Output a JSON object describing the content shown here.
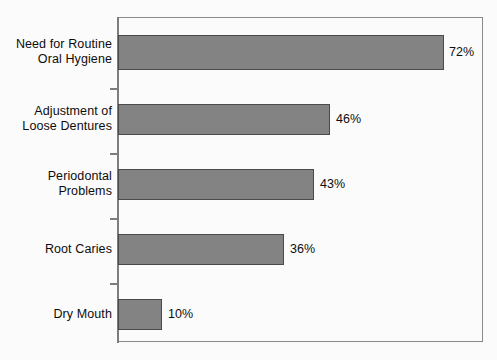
{
  "chart_data": {
    "type": "bar",
    "orientation": "horizontal",
    "title": "",
    "xlabel": "",
    "ylabel": "",
    "xlim": [
      0,
      100
    ],
    "grid": false,
    "legend": false,
    "categories": [
      "Need for Routine\nOral Hygiene",
      "Adjustment of\nLoose Dentures",
      "Periodontal\nProblems",
      "Root Caries",
      "Dry Mouth"
    ],
    "values": [
      72,
      46,
      43,
      36,
      10
    ],
    "value_labels": [
      "72%",
      "46%",
      "43%",
      "36%",
      "10%"
    ],
    "bar_color": "#838383",
    "bar_border_color": "#4a4a4a",
    "axis_color": "#7d7d7d",
    "frame_color": "#8a8a8a",
    "text_color": "#0d0d0d",
    "background": "#fbfbfb"
  },
  "bars": [
    {
      "label": "Need for Routine\nOral Hygiene",
      "value_label": "72%",
      "top": 35,
      "height": 35,
      "width": 326,
      "label_center": 52,
      "value_x": 449
    },
    {
      "label": "Adjustment of\nLoose Dentures",
      "value_label": "46%",
      "top": 104,
      "height": 31,
      "width": 212,
      "label_center": 119,
      "value_x": 336
    },
    {
      "label": "Periodontal\nProblems",
      "value_label": "43%",
      "top": 169,
      "height": 31,
      "width": 196,
      "label_center": 184,
      "value_x": 320
    },
    {
      "label": "Root Caries",
      "value_label": "36%",
      "top": 234,
      "height": 31,
      "width": 166,
      "label_center": 249,
      "value_x": 290
    },
    {
      "label": "Dry Mouth",
      "value_label": "10%",
      "top": 299,
      "height": 31,
      "width": 44,
      "label_center": 314,
      "value_x": 168
    }
  ],
  "ticks": [
    {
      "y": 88
    },
    {
      "y": 153
    },
    {
      "y": 218
    },
    {
      "y": 283
    }
  ]
}
